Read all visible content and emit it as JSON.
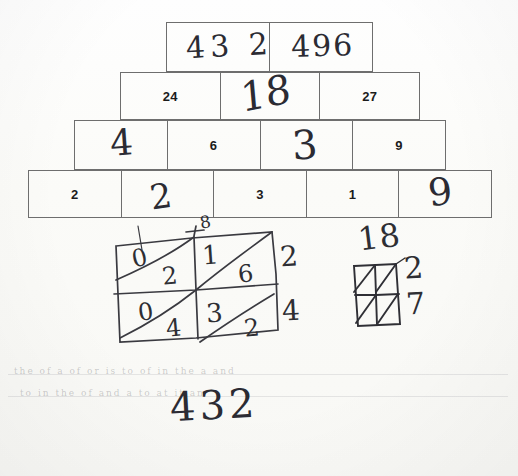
{
  "document": {
    "kind": "handwritten-math-worksheet",
    "title": "Number pyramid and lattice multiplication",
    "ink_color": "#2b2b33",
    "print_color": "#1b1b1b",
    "box_border_color": "#6e6e6e"
  },
  "pyramid": {
    "rows": [
      {
        "index": 1,
        "cells": [
          {
            "value": "43 2",
            "style": "handwritten"
          },
          {
            "value": "496",
            "style": "handwritten"
          }
        ]
      },
      {
        "index": 2,
        "cells": [
          {
            "value": "24",
            "style": "printed"
          },
          {
            "value": "18",
            "style": "handwritten"
          },
          {
            "value": "27",
            "style": "printed"
          }
        ]
      },
      {
        "index": 3,
        "cells": [
          {
            "value": "4",
            "style": "handwritten"
          },
          {
            "value": "6",
            "style": "printed"
          },
          {
            "value": "3",
            "style": "handwritten"
          },
          {
            "value": "9",
            "style": "printed"
          }
        ]
      },
      {
        "index": 4,
        "cells": [
          {
            "value": "2",
            "style": "printed"
          },
          {
            "value": "2",
            "style": "handwritten"
          },
          {
            "value": "3",
            "style": "printed"
          },
          {
            "value": "1",
            "style": "printed"
          },
          {
            "value": "9",
            "style": "handwritten"
          }
        ]
      }
    ]
  },
  "lattice_main": {
    "label": "2x2 lattice multiplication work",
    "top_marks": [
      "8"
    ],
    "cells": [
      {
        "position": "top-left",
        "upper": "0",
        "lower": "2"
      },
      {
        "position": "top-right",
        "upper": "1",
        "lower": "6"
      },
      {
        "position": "bottom-left",
        "upper": "0",
        "lower": "4"
      },
      {
        "position": "bottom-right",
        "upper": "3",
        "lower": "2"
      }
    ],
    "right_margin": [
      "2",
      "4"
    ]
  },
  "lattice_small": {
    "label": "small 2x2 lattice",
    "top_value": "18",
    "right_values": [
      "2",
      "7"
    ]
  },
  "answer": {
    "value": "432"
  },
  "bleed_through": {
    "lines": [
      "the  of  a   of    or   is  to     of    in  the     a   and",
      "to    in   the    of   and    a   to    at    it   an"
    ]
  }
}
